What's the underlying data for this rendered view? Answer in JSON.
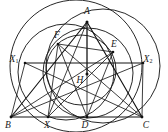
{
  "figure": {
    "type": "euclidean-geometry-diagram",
    "canvas": {
      "width": 168,
      "height": 132,
      "background": "#ffffff"
    },
    "ink_color": "#1a1a1a"
  },
  "labels": {
    "A": {
      "text": "A",
      "sub": "",
      "x": 87,
      "y": 12
    },
    "B": {
      "text": "B",
      "sub": "",
      "x": 8,
      "y": 126
    },
    "C": {
      "text": "C",
      "sub": "",
      "x": 146,
      "y": 126
    },
    "D": {
      "text": "D",
      "sub": "",
      "x": 85,
      "y": 126
    },
    "E": {
      "text": "E",
      "sub": "",
      "x": 114,
      "y": 45
    },
    "F": {
      "text": "F",
      "sub": "",
      "x": 57,
      "y": 36
    },
    "H": {
      "text": "H",
      "sub": "",
      "x": 80,
      "y": 81
    },
    "X": {
      "text": "X",
      "sub": "",
      "x": 47,
      "y": 126
    },
    "X1": {
      "text": "X",
      "sub": "1",
      "x": 14,
      "y": 60
    },
    "X2": {
      "text": "X",
      "sub": "2",
      "x": 148,
      "y": 60
    }
  },
  "points": {
    "A": {
      "x": 87,
      "y": 22
    },
    "B": {
      "x": 11,
      "y": 117
    },
    "C": {
      "x": 142,
      "y": 117
    },
    "D": {
      "x": 87,
      "y": 117
    },
    "H": {
      "x": 87,
      "y": 74
    },
    "E": {
      "x": 113,
      "y": 52
    },
    "F": {
      "x": 58,
      "y": 44
    },
    "X": {
      "x": 48,
      "y": 117
    },
    "X1": {
      "x": 25,
      "y": 63
    },
    "X2": {
      "x": 143,
      "y": 63
    }
  },
  "segments": [
    {
      "name": "side-BC",
      "from": "B",
      "to": "C"
    },
    {
      "name": "side-AB",
      "from": "B",
      "to": "A"
    },
    {
      "name": "side-AC",
      "from": "A",
      "to": "C"
    },
    {
      "name": "altitude-AD",
      "from": "A",
      "to": "D"
    },
    {
      "name": "altitude-BE",
      "from": "B",
      "to": "E"
    },
    {
      "name": "altitude-CF",
      "from": "C",
      "to": "F"
    },
    {
      "name": "cevian-AX",
      "from": "A",
      "to": "X"
    },
    {
      "name": "chord-X1X2",
      "from": "X1",
      "to": "X2"
    },
    {
      "name": "segment-BX1",
      "from": "B",
      "to": "X1"
    },
    {
      "name": "segment-CX2",
      "from": "C",
      "to": "X2"
    },
    {
      "name": "segment-X1C",
      "from": "X1",
      "to": "C"
    },
    {
      "name": "segment-X2B",
      "from": "X2",
      "to": "B"
    },
    {
      "name": "segment-EF",
      "from": "F",
      "to": "E"
    },
    {
      "name": "segment-AH",
      "from": "A",
      "to": "H"
    },
    {
      "name": "segment-XE",
      "from": "X",
      "to": "E"
    },
    {
      "name": "segment-FD",
      "from": "F",
      "to": "D"
    },
    {
      "name": "segment-ED",
      "from": "E",
      "to": "D"
    },
    {
      "name": "segment-FX",
      "from": "F",
      "to": "X"
    }
  ],
  "circles": [
    {
      "name": "circumcircle-ABC",
      "cx": 76,
      "cy": 66,
      "r": 66
    },
    {
      "name": "nine-point-circle",
      "cx": 81,
      "cy": 70,
      "r": 35
    },
    {
      "name": "circle-through-A-D",
      "cx": 88,
      "cy": 73,
      "r": 45
    },
    {
      "name": "circle-right-large",
      "cx": 103,
      "cy": 66,
      "r": 57
    },
    {
      "name": "circle-left-arc",
      "cx": 66,
      "cy": 72,
      "r": 48
    }
  ],
  "vertex_markers": [
    "A",
    "B",
    "C",
    "D",
    "H",
    "E",
    "F",
    "X",
    "X1",
    "X2"
  ]
}
